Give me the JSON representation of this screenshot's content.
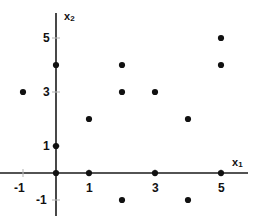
{
  "chart_data": {
    "type": "scatter",
    "title": "",
    "xlabel": "x1",
    "ylabel": "x2",
    "xlim": [
      -1.7,
      5.7
    ],
    "ylim": [
      -1.6,
      5.9
    ],
    "grid": false,
    "legend": null,
    "xticks": [
      -1,
      1,
      3,
      5
    ],
    "xtick_labels": [
      "-1",
      "1",
      "3",
      "5"
    ],
    "yticks": [
      -1,
      1,
      3,
      5
    ],
    "ytick_labels": [
      "-1",
      "1",
      "3",
      "5"
    ],
    "marker": "filled-circle",
    "marker_color": "#111111",
    "axis_color": "#1a1a1a",
    "points": [
      {
        "x": -1,
        "y": 3
      },
      {
        "x": 0,
        "y": 4
      },
      {
        "x": 0,
        "y": 1
      },
      {
        "x": 0,
        "y": 0
      },
      {
        "x": 1,
        "y": 2
      },
      {
        "x": 1,
        "y": 0
      },
      {
        "x": 2,
        "y": 4
      },
      {
        "x": 2,
        "y": 3
      },
      {
        "x": 2,
        "y": -1
      },
      {
        "x": 3,
        "y": 3
      },
      {
        "x": 3,
        "y": 0
      },
      {
        "x": 4,
        "y": 2
      },
      {
        "x": 4,
        "y": -1
      },
      {
        "x": 5,
        "y": 5
      },
      {
        "x": 5,
        "y": 4
      },
      {
        "x": 5,
        "y": 0
      }
    ]
  },
  "axis_labels": {
    "x": {
      "base": "x",
      "sub": "1"
    },
    "y": {
      "base": "x",
      "sub": "2"
    }
  }
}
